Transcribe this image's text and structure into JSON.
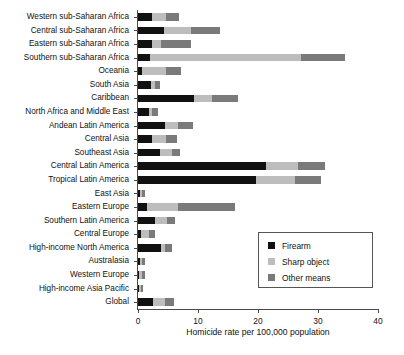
{
  "chart_data": {
    "type": "bar",
    "orientation": "horizontal",
    "stacked": true,
    "title": "",
    "xlabel": "Homicide rate per 100,000 population",
    "ylabel": "",
    "xlim": [
      0,
      40
    ],
    "xticks": [
      0,
      10,
      20,
      30,
      40
    ],
    "xtick_labels": [
      "0",
      "10",
      "20",
      "30",
      "40"
    ],
    "grid": false,
    "legend_position": "lower right",
    "categories": [
      "Western sub-Saharan Africa",
      "Central sub-Saharan Africa",
      "Eastern sub-Saharan Africa",
      "Southern sub-Saharan Africa",
      "Oceania",
      "South Asia",
      "Caribbean",
      "North Africa and Middle East",
      "Andean Latin America",
      "Central Asia",
      "Southeast Asia",
      "Central Latin America",
      "Tropical Latin America",
      "East Asia",
      "Eastern Europe",
      "Southern Latin America",
      "Central Europe",
      "High-income North America",
      "Australasia",
      "Western Europe",
      "High-income Asia Pacific",
      "Global"
    ],
    "series": [
      {
        "name": "Firearm",
        "color": "#111111",
        "values": [
          2.3,
          4.4,
          2.4,
          2.0,
          0.6,
          2.1,
          9.4,
          1.8,
          4.5,
          2.3,
          3.7,
          21.4,
          19.6,
          0.3,
          1.5,
          2.9,
          0.5,
          3.8,
          0.3,
          0.2,
          0.2,
          2.5
        ]
      },
      {
        "name": "Sharp object",
        "color": "#bdbdbd",
        "values": [
          2.4,
          4.5,
          1.5,
          25.1,
          4.1,
          0.8,
          3.0,
          0.5,
          2.2,
          2.4,
          2.0,
          5.2,
          6.5,
          0.3,
          5.2,
          2.0,
          1.3,
          0.7,
          0.3,
          0.4,
          0.3,
          2.0
        ]
      },
      {
        "name": "Other means",
        "color": "#7a7a7a",
        "values": [
          2.2,
          4.7,
          5.0,
          7.4,
          2.4,
          0.8,
          4.2,
          1.0,
          2.5,
          1.8,
          1.3,
          4.5,
          4.4,
          0.6,
          9.4,
          1.3,
          1.1,
          1.1,
          0.5,
          0.5,
          0.4,
          1.5
        ]
      }
    ]
  },
  "legend": {
    "entries": [
      {
        "label": "Firearm",
        "color": "#111111"
      },
      {
        "label": "Sharp object",
        "color": "#bdbdbd"
      },
      {
        "label": "Other means",
        "color": "#7a7a7a"
      }
    ]
  }
}
